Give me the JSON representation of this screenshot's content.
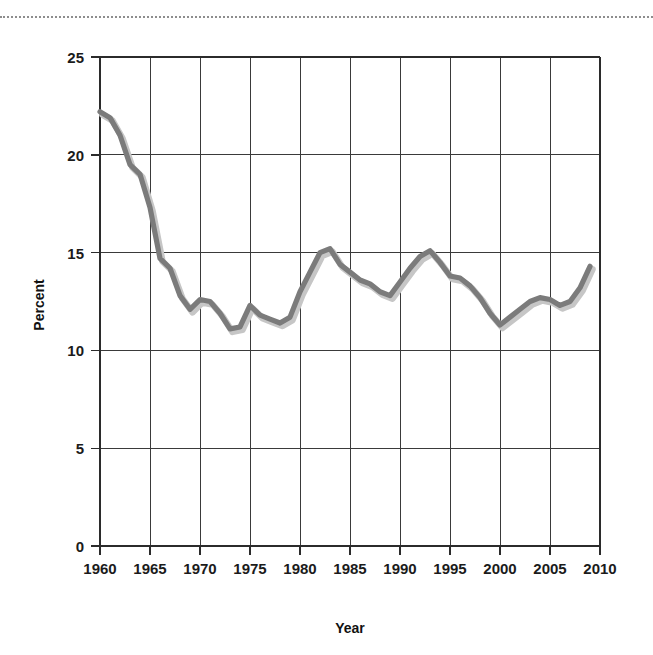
{
  "figure": {
    "background_color": "#ffffff",
    "divider": {
      "style": "dotted",
      "color": "#8d8d8d"
    }
  },
  "chart_data": {
    "type": "line",
    "title": "",
    "xlabel": "Year",
    "ylabel": "Percent",
    "xlim": [
      1960,
      2010
    ],
    "ylim": [
      0,
      25
    ],
    "xticks": [
      1960,
      1965,
      1970,
      1975,
      1980,
      1985,
      1990,
      1995,
      2000,
      2005,
      2010
    ],
    "yticks": [
      0,
      5,
      10,
      15,
      20,
      25
    ],
    "xtick_labels": [
      "1960",
      "1965",
      "1970",
      "1975",
      "1980",
      "1985",
      "1990",
      "1995",
      "2000",
      "2005",
      "2010"
    ],
    "ytick_labels": [
      "0",
      "5",
      "10",
      "15",
      "20",
      "25"
    ],
    "grid": true,
    "legend": false,
    "legend_position": "none",
    "line_color": "#7b7b7b",
    "shadow_color": "#c6c6c6",
    "series": [
      {
        "name": "Percent",
        "x": [
          1960,
          1961,
          1962,
          1963,
          1964,
          1965,
          1966,
          1967,
          1968,
          1969,
          1970,
          1971,
          1972,
          1973,
          1974,
          1975,
          1976,
          1977,
          1978,
          1979,
          1980,
          1981,
          1982,
          1983,
          1984,
          1985,
          1986,
          1987,
          1988,
          1989,
          1990,
          1991,
          1992,
          1993,
          1994,
          1995,
          1996,
          1997,
          1998,
          1999,
          2000,
          2001,
          2002,
          2003,
          2004,
          2005,
          2006,
          2007,
          2008,
          2009
        ],
        "y": [
          22.2,
          21.9,
          21.0,
          19.5,
          19.0,
          17.3,
          14.7,
          14.2,
          12.8,
          12.1,
          12.6,
          12.5,
          11.9,
          11.1,
          11.2,
          12.3,
          11.8,
          11.6,
          11.4,
          11.7,
          13.0,
          14.0,
          15.0,
          15.2,
          14.4,
          14.0,
          13.6,
          13.4,
          13.0,
          12.8,
          13.5,
          14.2,
          14.8,
          15.1,
          14.5,
          13.8,
          13.7,
          13.3,
          12.7,
          11.9,
          11.3,
          11.7,
          12.1,
          12.5,
          12.7,
          12.6,
          12.3,
          12.5,
          13.2,
          14.3
        ]
      }
    ]
  }
}
